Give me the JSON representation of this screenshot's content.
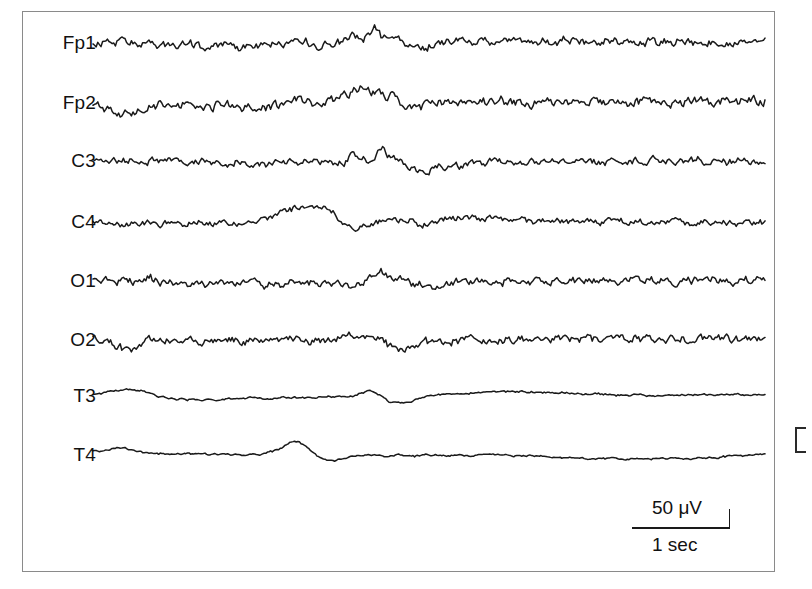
{
  "figure": {
    "type": "eeg-recording",
    "background_color": "#ffffff",
    "trace_color": "#1a1a1a",
    "frame_color": "#8a8a8a"
  },
  "channels": [
    {
      "label": "Fp1",
      "baseline_y": 43
    },
    {
      "label": "Fp2",
      "baseline_y": 103
    },
    {
      "label": "C3",
      "baseline_y": 161
    },
    {
      "label": "C4",
      "baseline_y": 222
    },
    {
      "label": "O1",
      "baseline_y": 281
    },
    {
      "label": "O2",
      "baseline_y": 340
    },
    {
      "label": "T3",
      "baseline_y": 396
    },
    {
      "label": "T4",
      "baseline_y": 455
    }
  ],
  "scalebar": {
    "amplitude_label": "50 μV",
    "time_label": "1 sec",
    "line_left": 632,
    "line_right": 730,
    "line_y": 527,
    "tick_height": 18
  },
  "chart_data": {
    "type": "line",
    "title": "",
    "xlabel": "",
    "ylabel": "",
    "amplitude_scale": "50 μV",
    "time_scale": "1 sec",
    "x_start": 93,
    "x_end": 765,
    "series": [
      {
        "name": "Fp1",
        "baseline": 43,
        "values": [
          0,
          1,
          2,
          1,
          -1,
          0,
          2,
          1,
          0,
          -2,
          -1,
          1,
          -3,
          -2,
          0,
          -1,
          -4,
          -3,
          -1,
          -2,
          -4,
          -3,
          -2,
          -4,
          -3,
          -5,
          -4,
          -3,
          -5,
          -4,
          -2,
          -3,
          -5,
          -4,
          -3,
          -4,
          -2,
          -3,
          -5,
          -4,
          -3,
          -2,
          -4,
          -3,
          -1,
          -2,
          -4,
          -3,
          -2,
          -4,
          -3,
          -5,
          -4,
          -3,
          -4,
          -2,
          -3,
          -1,
          -2,
          -4,
          -3,
          -2,
          -3,
          -1,
          -2,
          -3,
          -1,
          0,
          -2,
          -1,
          -3,
          -2,
          -1,
          -2,
          0,
          -1,
          -3,
          -2,
          -1,
          -2,
          -4,
          -3,
          -2,
          -3,
          -1,
          -2,
          -3,
          -4,
          -2,
          -3,
          -1,
          -2,
          -3,
          -1,
          0,
          -2,
          -1,
          0,
          -2,
          -1,
          -3,
          -2,
          -4,
          -3,
          -2,
          -3,
          -5,
          -4,
          -3,
          -4,
          -2,
          -3,
          -4,
          -5,
          -3,
          -4,
          -6,
          -5,
          -4,
          -5,
          -3,
          -4,
          -6,
          -5,
          -4,
          -6,
          -5,
          -7,
          -6,
          -5,
          -7,
          -6,
          -8,
          -7,
          -6,
          -5,
          -7,
          -6,
          -4,
          -5,
          -7,
          -6,
          -5,
          -4,
          -6,
          -5,
          -3,
          -4,
          -6,
          -5,
          -7,
          -6,
          -8,
          -9,
          -11,
          -13,
          -16,
          -19,
          -22,
          -20,
          -17,
          -14,
          -11,
          -9,
          -7,
          -5,
          -4,
          -6,
          -5,
          -3,
          -4,
          -2,
          -3,
          -1,
          -2,
          -4,
          -3,
          -1,
          -2,
          0,
          -1,
          1,
          0,
          -2,
          -1,
          1,
          0,
          2,
          1,
          -1,
          0,
          2,
          1,
          3,
          2,
          0,
          1,
          3,
          2,
          1,
          0,
          2,
          1,
          3,
          2,
          1,
          3,
          2,
          0,
          1,
          3,
          2,
          4,
          3,
          1,
          2,
          4,
          3,
          2,
          4,
          3,
          5,
          4,
          2,
          3,
          5,
          4,
          6,
          5,
          3,
          4,
          2,
          3,
          5,
          4,
          6,
          5,
          7,
          6,
          4,
          5,
          3,
          4,
          6,
          5,
          7,
          6,
          8,
          7,
          5,
          6,
          4,
          5,
          3,
          4,
          6,
          5,
          7,
          6,
          8,
          7,
          9,
          8,
          6,
          7,
          5,
          6,
          4,
          5,
          3,
          4,
          2,
          3,
          1,
          2,
          0,
          1,
          -1,
          0,
          -2,
          -1,
          -3,
          -2,
          -4,
          -3,
          -5,
          -4,
          -6,
          -5,
          -7,
          -6,
          -5,
          -4,
          -6,
          -5,
          -3,
          -4,
          -2,
          -3,
          -1,
          -2,
          0,
          -1,
          1,
          0,
          2,
          1,
          3,
          2,
          4,
          3,
          5,
          4,
          2,
          3,
          1,
          2,
          0,
          1,
          -1,
          0,
          -2,
          -1,
          -3,
          -2,
          -4,
          -3,
          -5,
          -4,
          -3,
          -2,
          -4,
          -3,
          -1,
          -2,
          0,
          -1,
          1,
          0,
          -2,
          -1,
          -3,
          -2,
          -1,
          0,
          -2,
          -1,
          -3,
          -2,
          -4,
          -3,
          -5,
          -4,
          -3,
          -2,
          -4,
          -3,
          -5,
          -4,
          -6,
          -5,
          -4,
          -3,
          -5,
          -4,
          -2,
          -3,
          -1,
          -2,
          -4,
          -3,
          -2,
          -1,
          -3,
          -2,
          -4,
          -3,
          -5,
          -4,
          -3,
          -2,
          -4,
          -3,
          -1,
          -2,
          -4,
          -3,
          -5,
          -4,
          -6,
          -5,
          -4,
          -3,
          -5,
          -4,
          -2,
          -3,
          -5,
          -4,
          -6,
          -5,
          -4,
          -3,
          -5,
          -4,
          -6,
          -5,
          -3,
          -4,
          -2,
          -3,
          -5,
          -4,
          -6,
          -5,
          -7,
          -6,
          -5,
          -4,
          -6,
          -5,
          -7,
          -6,
          -4,
          -5,
          -3,
          -4,
          -6,
          -5,
          -7,
          -6,
          -8,
          -7,
          -6,
          -5,
          -7,
          -6,
          -8,
          -7,
          -5,
          -6,
          -4,
          -5,
          -7,
          -6,
          -8,
          -7,
          -9,
          -8,
          -7,
          -6,
          -8,
          -7,
          -9,
          -8,
          -6,
          -7,
          -5,
          -6,
          -8,
          -7,
          -9,
          -8,
          -7,
          -6,
          -8,
          -7,
          -5,
          -6,
          -8,
          -7,
          -9,
          -8,
          -10,
          -9,
          -8,
          -7,
          -9,
          -8,
          -6,
          -7,
          -9,
          -8,
          -10,
          -9,
          -11,
          -10,
          -9,
          -8,
          -10,
          -9,
          -7,
          -8,
          -10,
          -9,
          -11,
          -10,
          -9,
          -8,
          -10,
          -9,
          -7,
          -8,
          -6,
          -7,
          -9,
          -8,
          -10,
          -9,
          -8,
          -7,
          -9,
          -8,
          -6,
          -7,
          -5,
          -6,
          -8,
          -7,
          -9,
          -8,
          -7,
          -6,
          -8,
          -7,
          -9,
          -8,
          -6,
          -7,
          -5,
          -6,
          -8,
          -7,
          -6,
          -5,
          -7,
          -6,
          -8,
          -7,
          -9,
          -8,
          -7,
          -6,
          -8,
          -7,
          -5,
          -6,
          -8,
          -7,
          -9,
          -8,
          -10,
          -9,
          -8,
          -7,
          -9,
          -8,
          -10,
          -9,
          -11,
          -10,
          -9,
          -8,
          -10,
          -9,
          -11,
          -10,
          -12,
          -11,
          -10,
          -9,
          -11,
          -10,
          -12,
          -11,
          -13,
          -12,
          -11,
          -10,
          -12,
          -11,
          -9,
          -10,
          -12,
          -11,
          -13,
          -12,
          -11,
          -10,
          -12,
          -11,
          -13,
          -12,
          -10,
          -11,
          -9,
          -10,
          -12,
          -11,
          -13,
          -12,
          -11,
          -10,
          -12,
          -11,
          -9,
          -10,
          -8,
          -9,
          -11,
          -10,
          -12,
          -11,
          -10,
          -9,
          -11,
          -10,
          -8,
          -9,
          -7,
          -8,
          -10,
          -9,
          -11,
          -10,
          -9,
          -8,
          -10,
          -9,
          -7,
          -8,
          -6,
          -7,
          -9,
          -8,
          -10,
          -9,
          -8,
          -7,
          -9,
          -8,
          -10,
          -9
        ]
      },
      {
        "name": "Fp2",
        "baseline": 103,
        "values": [
          0,
          2,
          4,
          3,
          1,
          0,
          2,
          4,
          6,
          5,
          3,
          2,
          4,
          3,
          1,
          0,
          -2,
          -1,
          -3,
          -4,
          -6,
          -5,
          -7,
          -8,
          -10,
          -9,
          -11,
          -12,
          -14,
          -13,
          -12,
          -14,
          -13,
          -15,
          -14,
          -16,
          -15,
          -14,
          -16,
          -15,
          -13,
          -14,
          -16,
          -15,
          -17,
          -16,
          -15,
          -14,
          -16,
          -15,
          -17,
          -16,
          -18,
          -17,
          -16,
          -15,
          -17,
          -16,
          -14,
          -15,
          -17,
          -16,
          -15,
          -14,
          -16,
          -15,
          -13,
          -14,
          -16,
          -15,
          -17,
          -16,
          -15,
          -14,
          -16,
          -15,
          -17,
          -16,
          -18,
          -17,
          -16,
          -15,
          -17,
          -16,
          -14,
          -15,
          -13,
          -14,
          -16,
          -15,
          -17,
          -16,
          -15,
          -14,
          -16,
          -15,
          -17,
          -16,
          -18,
          -17,
          -19,
          -18,
          -17,
          -16,
          -18,
          -17,
          -19,
          -18,
          -20,
          -19,
          -18,
          -17,
          -19,
          -18,
          -16,
          -17,
          -19,
          -18,
          -20,
          -19,
          -18,
          -17,
          -19,
          -18,
          -16,
          -17,
          -15,
          -16,
          -18,
          -17,
          -19,
          -18,
          -17,
          -16,
          -18,
          -17,
          -15,
          -16,
          -14,
          -15,
          -13,
          -14,
          -12,
          -13,
          -11,
          -12,
          -10,
          -11,
          -9,
          -10,
          -8,
          -9,
          -7,
          -8,
          -6,
          -7,
          -5,
          -6,
          -8,
          -7,
          -9,
          -8,
          -10,
          -9,
          -11,
          -10,
          -12,
          -11,
          -13,
          -12,
          -14,
          -13,
          -15,
          -14,
          -13,
          -12,
          -14,
          -13,
          -11,
          -12,
          -10,
          -11,
          -9,
          -10,
          -8,
          -9,
          -7,
          -8,
          -6,
          -7,
          -5,
          -6,
          -4,
          -5,
          -3,
          -4,
          -2,
          -3,
          -1,
          -2,
          0,
          -1,
          1,
          0,
          2,
          1,
          3,
          2,
          4,
          3,
          5,
          4,
          6,
          5,
          7,
          6,
          8,
          7,
          9,
          8,
          10,
          9,
          11,
          10,
          12,
          11,
          13,
          12,
          14,
          13,
          15,
          14,
          16,
          15,
          17,
          16,
          18,
          17,
          19,
          18,
          20,
          19,
          21,
          20,
          22,
          21,
          20,
          19,
          21,
          20,
          18,
          19,
          17,
          18,
          16,
          17,
          15,
          16,
          14,
          15,
          13,
          14,
          12,
          13,
          11,
          12,
          10,
          11,
          9,
          10,
          8,
          9,
          7,
          8,
          6,
          7,
          5,
          6,
          4,
          5,
          3,
          4,
          2,
          3,
          1,
          2,
          0,
          1,
          -1,
          0,
          -2,
          -1,
          -3,
          -2,
          -4,
          -3,
          -5,
          -4,
          -6,
          -5,
          -7,
          -6,
          -8,
          -7,
          -9,
          -8,
          -10,
          -9,
          -11,
          -10,
          -12,
          -11,
          -13,
          -12,
          -14,
          -13,
          -15,
          -14,
          -16,
          -15,
          -17,
          -16,
          -18,
          -17,
          -19,
          -18,
          -20,
          -19,
          -21,
          -20,
          -22,
          -21,
          -23,
          -22,
          -24,
          -23,
          -25,
          -24,
          -26,
          -25,
          -27,
          -26,
          -25,
          -24,
          -26,
          -25,
          -23,
          -24,
          -22,
          -23,
          -21,
          -22,
          -20,
          -21,
          -19,
          -20,
          -18,
          -19,
          -17,
          -18,
          -16,
          -17,
          -15,
          -16,
          -14,
          -15,
          -13,
          -14,
          -12,
          -13,
          -11,
          -12,
          -10,
          -11,
          -9,
          -10,
          -8,
          -9,
          -7,
          -8,
          -6,
          -7,
          -5,
          -6,
          -4,
          -5,
          -3,
          -4,
          -2,
          -3,
          -1,
          -2,
          0,
          -1,
          1,
          0,
          -2,
          -1,
          -3,
          -2,
          -4,
          -3,
          -5,
          -4,
          -6,
          -5,
          -7,
          -6,
          -8,
          -7,
          -9,
          -8,
          -10,
          -9,
          -11,
          -10,
          -12,
          -11,
          -13,
          -12,
          -14,
          -13,
          -15,
          -14,
          -16,
          -15,
          -17,
          -16,
          -18,
          -17,
          -19,
          -18,
          -20,
          -19,
          -21,
          -20,
          -22,
          -21,
          -23,
          -22,
          -24,
          -23,
          -25,
          -24,
          -26,
          -25,
          -27,
          -26,
          -28,
          -27,
          -29,
          -28,
          -30,
          -29,
          -31,
          -30,
          -32,
          -31,
          -33,
          -32,
          -34,
          -33,
          -35,
          -34,
          -36,
          -35,
          -37,
          -36,
          -38,
          -37,
          -39,
          -38,
          -40,
          -39,
          -41,
          -40,
          -42,
          -41,
          -43,
          -42,
          -44,
          -43,
          -45,
          -44,
          -46,
          -45,
          -47,
          -46,
          -48,
          -47,
          -49,
          -48,
          -50,
          -49,
          -51,
          -50,
          -52,
          -51,
          -53,
          -52,
          -54,
          -53,
          -55,
          -54,
          -56,
          -55,
          -57,
          -56,
          -58,
          -57,
          -59,
          -58,
          -60,
          -59,
          -61,
          -60,
          -62,
          -61,
          -63,
          -62,
          -64,
          -63,
          -65,
          -64,
          -66,
          -65,
          -67,
          -66,
          -68,
          -67,
          -69,
          -68,
          -70,
          -69,
          -71,
          -70,
          -72,
          -71,
          -73,
          -72,
          -74,
          -73,
          -75,
          -74,
          -76,
          -75,
          -77,
          -76,
          -78,
          -77,
          -79,
          -78,
          -80,
          -79,
          -81,
          -80,
          -82,
          -81,
          -83,
          -82,
          -84,
          -83,
          -85,
          -84,
          -86,
          -85,
          -87,
          -86,
          -88,
          -87,
          -89,
          -88,
          -90,
          -89,
          -91,
          -90,
          -92,
          -91,
          -93,
          -92,
          -94,
          -93,
          -95,
          -94,
          -96,
          -95,
          -97,
          -96,
          -98,
          -97,
          -99,
          -98,
          -100,
          -99,
          -101,
          -100,
          -102,
          -101,
          -103,
          -102,
          -104,
          -103,
          -105,
          -104,
          -106,
          -105,
          -107,
          -106,
          -108,
          -107,
          -109,
          -108,
          -110,
          -109
        ]
      }
    ],
    "note": "8-channel EEG showing low-voltage background with transient deflections mid-record"
  }
}
